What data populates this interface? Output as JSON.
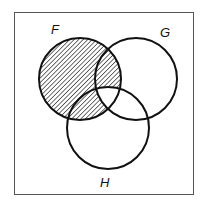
{
  "diagram": {
    "type": "venn",
    "sets": [
      {
        "label": "F",
        "cx": 80,
        "cy": 79,
        "r": 41
      },
      {
        "label": "G",
        "cx": 136,
        "cy": 79,
        "r": 41
      },
      {
        "label": "H",
        "cx": 108,
        "cy": 128,
        "r": 41
      }
    ],
    "shaded_region": "F minus (G ∩ H)",
    "labels": {
      "f": "F",
      "g": "G",
      "h": "H"
    },
    "colors": {
      "stroke": "#111111",
      "frame": "#555555",
      "hatch": "#222222",
      "background": "#ffffff"
    }
  }
}
